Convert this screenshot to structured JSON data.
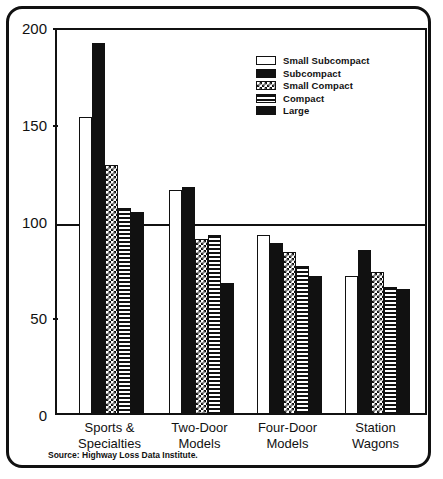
{
  "chart_data": {
    "type": "bar",
    "title": "",
    "subtitle": "",
    "xlabel": "",
    "ylabel": "",
    "ylim": [
      0,
      200
    ],
    "ytick_values": [
      0,
      50,
      100,
      150,
      200
    ],
    "ytick_labels": [
      "0",
      "50",
      "100",
      "150",
      "200"
    ],
    "grid": "horizontal line at 100 only",
    "legend_position": "upper-right inside plot",
    "categories": [
      "Sports &\nSpecialties",
      "Two-Door\nModels",
      "Four-Door\nModels",
      "Station\nWagons"
    ],
    "category_lines": [
      [
        "Sports &",
        "Specialties"
      ],
      [
        "Two-Door",
        "Models"
      ],
      [
        "Four-Door",
        "Models"
      ],
      [
        "Station",
        "Wagons"
      ]
    ],
    "series": [
      {
        "name": "Small Subcompact",
        "pattern": "open",
        "values": [
          153,
          115,
          92,
          71
        ]
      },
      {
        "name": "Subcompact",
        "pattern": "solid",
        "values": [
          191,
          117,
          88,
          84
        ]
      },
      {
        "name": "Small Compact",
        "pattern": "check",
        "values": [
          128,
          90,
          83,
          73
        ]
      },
      {
        "name": "Compact",
        "pattern": "hlines",
        "values": [
          106,
          92,
          76,
          65
        ]
      },
      {
        "name": "Large",
        "pattern": "solid",
        "values": [
          104,
          67,
          71,
          64
        ]
      }
    ],
    "annotations": {
      "source": "Source: Highway Loss Data Institute."
    },
    "colors": {
      "ink": "#111111",
      "background": "#ffffff"
    }
  },
  "legend": {
    "items": [
      {
        "label": "Small Subcompact",
        "pattern": "open"
      },
      {
        "label": "Subcompact",
        "pattern": "solid"
      },
      {
        "label": "Small Compact",
        "pattern": "check"
      },
      {
        "label": "Compact",
        "pattern": "hlines"
      },
      {
        "label": "Large",
        "pattern": "solid"
      }
    ]
  },
  "footer": {
    "source": "Source: Highway Loss Data Institute."
  }
}
